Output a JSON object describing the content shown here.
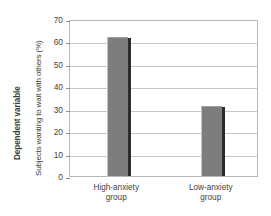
{
  "chart_data": {
    "type": "bar",
    "title": "",
    "subtitle": "",
    "categories": [
      "High-anxiety group",
      "Low-anxiety group"
    ],
    "category_lines": [
      [
        "High-anxiety",
        "group"
      ],
      [
        "Low-anxiety",
        "group"
      ]
    ],
    "values": [
      62,
      31
    ],
    "xlabel": "",
    "ylabel": "Subjects wanting to wait with others (%)",
    "axis_group_label": "Dependent variable",
    "ylim": [
      0,
      70
    ],
    "ytick_labels": [
      "0",
      "10",
      "20",
      "30",
      "40",
      "50",
      "60",
      "70"
    ],
    "ytick_values": [
      0,
      10,
      20,
      30,
      40,
      50,
      60,
      70
    ],
    "grid": true,
    "legend": false,
    "legend_position": "none",
    "colors": {
      "bar_fill": "#7d7d7d",
      "bar_shadow": "#2b2b2b",
      "gridline": "#c6c6c6",
      "frame": "#b9b9b9",
      "text": "#3f3f3f",
      "background": "#ffffff"
    }
  }
}
